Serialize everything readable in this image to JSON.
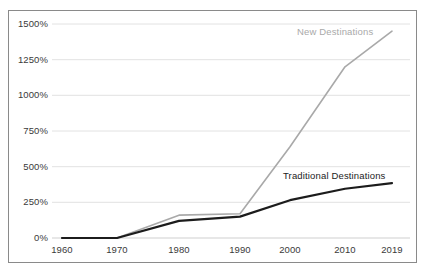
{
  "chart_data": {
    "type": "line",
    "title": "",
    "subtitle": "",
    "xlabel": "",
    "ylabel": "",
    "grid": true,
    "legend_position": "inline-annotation",
    "x": [
      1960,
      1970,
      1980,
      1990,
      2000,
      2010,
      2019
    ],
    "x_tick_labels": [
      "1960",
      "1970",
      "1980",
      "1990",
      "2000",
      "2010",
      "2019"
    ],
    "y_tick_values": [
      0,
      250,
      500,
      750,
      1000,
      1250,
      1500
    ],
    "y_tick_labels": [
      "0%",
      "250%",
      "500%",
      "750%",
      "1000%",
      "1250%",
      "1500%"
    ],
    "ylim": [
      0,
      1500
    ],
    "xlim": [
      1960,
      2019
    ],
    "series": [
      {
        "name": "New Destinations",
        "color": "#a9a9a9",
        "values": [
          0,
          0,
          160,
          170,
          640,
          1200,
          1450
        ]
      },
      {
        "name": "Traditional Destinations",
        "color": "#1c1c1c",
        "values": [
          0,
          0,
          120,
          150,
          265,
          345,
          385
        ]
      }
    ],
    "annotations": [
      {
        "text": "New Destinations",
        "color": "#a9a9a9"
      },
      {
        "text": "Traditional Destinations",
        "color": "#1c1c1c"
      }
    ]
  },
  "colors": {
    "new_destinations": "#a9a9a9",
    "traditional_destinations": "#1c1c1c",
    "gridline": "#e2e2e2",
    "frame_border": "#8a8a8a",
    "background": "#ffffff",
    "tick_text": "#3a3a3a"
  }
}
